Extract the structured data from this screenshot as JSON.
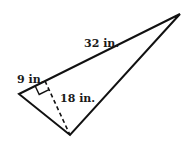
{
  "diagram": {
    "type": "triangle-with-altitude",
    "labels": {
      "hypotenuse": "32 in.",
      "short_segment": "9 in.",
      "altitude": "18 in."
    },
    "vertices": {
      "left": [
        19,
        94
      ],
      "top_right": [
        180,
        14
      ],
      "bottom": [
        70,
        135
      ]
    },
    "altitude_foot": [
      45,
      81
    ],
    "colors": {
      "stroke": "#111111",
      "background": "#ffffff"
    }
  }
}
